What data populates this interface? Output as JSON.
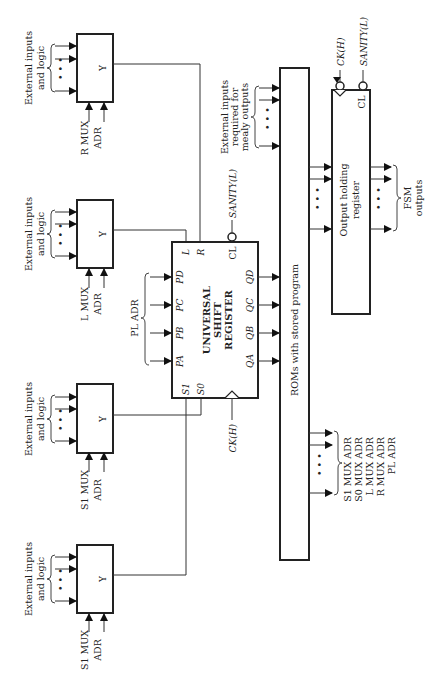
{
  "diagram": {
    "orientation": "rotated 90 degrees counter-clockwise",
    "muxes": [
      {
        "id": "r-mux",
        "inputs_label": [
          "External inputs",
          "and logic"
        ],
        "output_label": "Y",
        "adr_label": [
          "R MUX",
          "ADR"
        ]
      },
      {
        "id": "l-mux",
        "inputs_label": [
          "External inputs",
          "and logic"
        ],
        "output_label": "Y",
        "adr_label": [
          "L MUX",
          "ADR"
        ]
      },
      {
        "id": "s1-mux-upper",
        "inputs_label": [
          "External inputs",
          "and logic"
        ],
        "output_label": "Y",
        "adr_label": [
          "S1 MUX",
          "ADR"
        ]
      },
      {
        "id": "s1-mux-lower",
        "inputs_label": [
          "External inputs",
          "and logic"
        ],
        "output_label": "Y",
        "adr_label": [
          "S1 MUX",
          "ADR"
        ]
      }
    ],
    "dots": "• • •",
    "shift_register": {
      "title": [
        "UNIVERSAL",
        "SHIFT",
        "REGISTER"
      ],
      "parallel_inputs": [
        "PA",
        "PB",
        "PC",
        "PD"
      ],
      "parallel_input_group_label": "PL ADR",
      "serial_inputs": [
        "L",
        "R"
      ],
      "select_inputs": [
        "S1",
        "S0"
      ],
      "clear_pin": "CL",
      "outputs": [
        "QA",
        "QB",
        "QC",
        "QD"
      ],
      "clock_label": "CK(H)",
      "sanity_label": "SANITY(L)"
    },
    "rom": {
      "label": "ROMs with stored program",
      "mealy_inputs_label": [
        "External inputs",
        "required for",
        "mealy outputs"
      ],
      "address_outputs": [
        "S1 MUX ADR",
        "S0 MUX ADR",
        "L MUX ADR",
        "R MUX ADR",
        "PL ADR"
      ]
    },
    "output_register": {
      "label": [
        "Output holding",
        "register"
      ],
      "clear_pin": "CL",
      "clock_label": "CK(H)",
      "sanity_label": "SANITY(L)",
      "outputs_label": [
        "FSM",
        "outputs"
      ]
    }
  }
}
